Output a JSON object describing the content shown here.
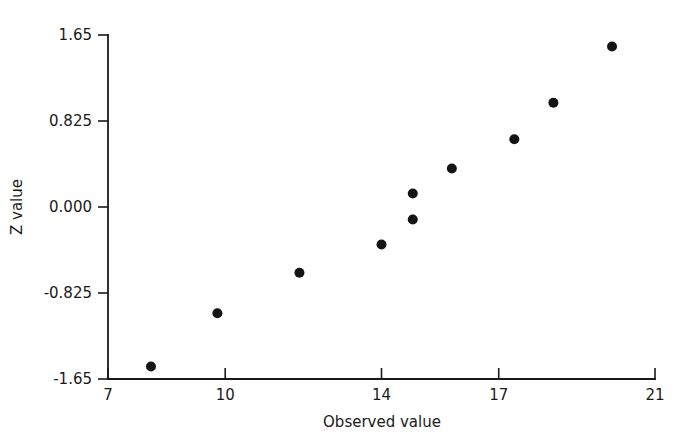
{
  "figure": {
    "background_color": "#ffffff",
    "ink_color": "#1a1a1a",
    "marker_color": "#141414"
  },
  "chart_data": {
    "type": "scatter",
    "title": "",
    "subtitle": "",
    "xlabel": "Observed value",
    "ylabel": "Z value",
    "xlim": [
      7,
      21
    ],
    "ylim": [
      -1.65,
      1.65
    ],
    "grid": false,
    "legend": null,
    "legend_position": "none",
    "xticks": [
      7,
      10,
      14,
      17,
      21
    ],
    "xtick_labels": [
      "7",
      "10",
      "14",
      "17",
      "21"
    ],
    "yticks": [
      1.65,
      0.825,
      0.0,
      -0.825,
      -1.65
    ],
    "ytick_labels": [
      "1.65",
      "0.825",
      "0.000",
      "-0.825",
      "-1.65"
    ],
    "marker": "filled-circle",
    "marker_size": 5,
    "n_points": 10,
    "x": [
      8.1,
      9.8,
      11.9,
      14.0,
      14.8,
      14.8,
      15.8,
      17.4,
      18.4,
      19.9
    ],
    "y": [
      -1.53,
      -1.02,
      -0.63,
      -0.36,
      -0.12,
      0.13,
      0.37,
      0.65,
      1.0,
      1.54
    ],
    "points": [
      {
        "x": 8.1,
        "y": -1.53
      },
      {
        "x": 9.8,
        "y": -1.02
      },
      {
        "x": 11.9,
        "y": -0.63
      },
      {
        "x": 14.0,
        "y": -0.36
      },
      {
        "x": 14.8,
        "y": -0.12
      },
      {
        "x": 14.8,
        "y": 0.13
      },
      {
        "x": 15.8,
        "y": 0.37
      },
      {
        "x": 17.4,
        "y": 0.65
      },
      {
        "x": 18.4,
        "y": 1.0
      },
      {
        "x": 19.9,
        "y": 1.54
      }
    ]
  },
  "plot_geometry": {
    "left": 108,
    "right": 655,
    "top": 35,
    "bottom": 379
  }
}
